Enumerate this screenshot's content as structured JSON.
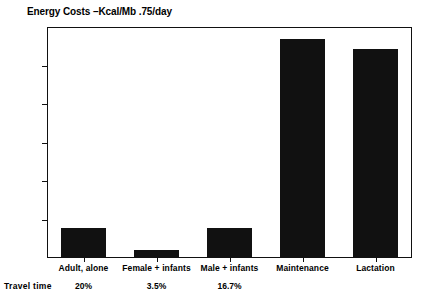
{
  "chart_data": {
    "type": "bar",
    "title": "Energy Costs –Kcal/Mb .75/day",
    "xlabel": "",
    "ylabel": "",
    "ylim": [
      0,
      120
    ],
    "yticks": [
      0,
      20,
      40,
      60,
      80,
      100,
      120
    ],
    "ytick_labels": [
      "0",
      "20",
      "40",
      "60",
      "80",
      "100",
      "120"
    ],
    "grid": false,
    "legend": "none",
    "bar_color": "#111111",
    "categories": [
      "Adult, alone",
      "Female + infants",
      "Male + infants",
      "Maintenance",
      "Lactation"
    ],
    "values": [
      15,
      3.5,
      15,
      113,
      108
    ],
    "annotations": {
      "row_label": "Travel time",
      "row_values": [
        "20%",
        "3.5%",
        "16.7%",
        "",
        ""
      ]
    }
  },
  "colors": {
    "bar": "#111111",
    "axis": "#111111",
    "background": "#ffffff"
  }
}
